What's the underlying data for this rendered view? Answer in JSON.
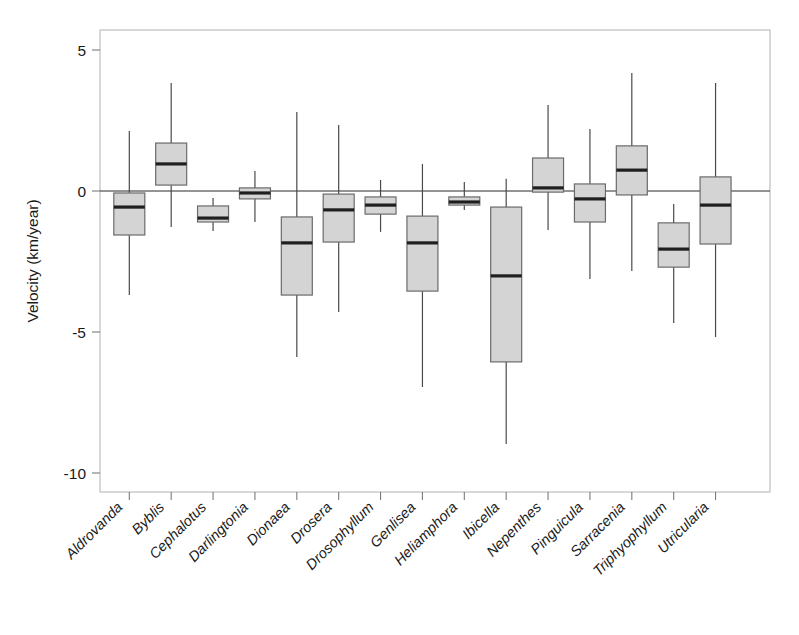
{
  "chart_data": {
    "type": "box",
    "title": "",
    "xlabel": "",
    "ylabel": "Velocity (km/year)",
    "ylim": [
      -11.3,
      6.1
    ],
    "yticks": [
      5,
      0,
      -5,
      -10
    ],
    "ytick_labels": [
      "5",
      "0",
      "-5",
      "-10"
    ],
    "grid": false,
    "legend": null,
    "zero_reference_line": 0,
    "categories": [
      "Aldrovanda",
      "Byblis",
      "Cephalotus",
      "Darlingtonia",
      "Dionaea",
      "Drosera",
      "Drosophyllum",
      "Genlisea",
      "Heliamphora",
      "Ibicella",
      "Nepenthes",
      "Pinguicula",
      "Sarracenia",
      "Triphyophyllum",
      "Utricularia"
    ],
    "boxes": [
      {
        "category": "Aldrovanda",
        "whisker_high": 2.13,
        "q3": -0.07,
        "median": -0.57,
        "q1": -1.56,
        "whisker_low": -3.69
      },
      {
        "category": "Byblis",
        "whisker_high": 3.83,
        "q3": 1.7,
        "median": 0.96,
        "q1": 0.21,
        "whisker_low": -1.28
      },
      {
        "category": "Cephalotus",
        "whisker_high": -0.25,
        "q3": -0.53,
        "median": -0.96,
        "q1": -1.1,
        "whisker_low": -1.42
      },
      {
        "category": "Darlingtonia",
        "whisker_high": 0.71,
        "q3": 0.11,
        "median": -0.07,
        "q1": -0.28,
        "whisker_low": -1.1
      },
      {
        "category": "Dionaea",
        "whisker_high": 2.8,
        "q3": -0.92,
        "median": -1.84,
        "q1": -3.69,
        "whisker_low": -5.89
      },
      {
        "category": "Drosera",
        "whisker_high": 2.34,
        "q3": -0.11,
        "median": -0.67,
        "q1": -1.81,
        "whisker_low": -4.29
      },
      {
        "category": "Drosophyllum",
        "whisker_high": 0.39,
        "q3": -0.21,
        "median": -0.5,
        "q1": -0.82,
        "whisker_low": -1.45
      },
      {
        "category": "Genlisea",
        "whisker_high": 0.96,
        "q3": -0.89,
        "median": -1.84,
        "q1": -3.55,
        "whisker_low": -6.95
      },
      {
        "category": "Heliamphora",
        "whisker_high": 0.32,
        "q3": -0.21,
        "median": -0.39,
        "q1": -0.5,
        "whisker_low": -0.67
      },
      {
        "category": "Ibicella",
        "whisker_high": 0.43,
        "q3": -0.57,
        "median": -3.01,
        "q1": -6.06,
        "whisker_low": -8.97
      },
      {
        "category": "Nepenthes",
        "whisker_high": 3.05,
        "q3": 1.17,
        "median": 0.11,
        "q1": -0.04,
        "whisker_low": -1.38
      },
      {
        "category": "Pinguicula",
        "whisker_high": 2.2,
        "q3": 0.25,
        "median": -0.28,
        "q1": -1.1,
        "whisker_low": -3.12
      },
      {
        "category": "Sarracenia",
        "whisker_high": 4.18,
        "q3": 1.6,
        "median": 0.74,
        "q1": -0.14,
        "whisker_low": -2.84
      },
      {
        "category": "Triphyophyllum",
        "whisker_high": -0.46,
        "q3": -1.13,
        "median": -2.06,
        "q1": -2.7,
        "whisker_low": -4.68
      },
      {
        "category": "Utricularia",
        "whisker_high": 3.83,
        "q3": 0.5,
        "median": -0.5,
        "q1": -1.88,
        "whisker_low": -5.18
      }
    ],
    "colors": {
      "box_fill": "#d4d4d4",
      "box_edge": "#6b6b6b",
      "median": "#1f1f1f",
      "whisker": "#4a4a4a",
      "frame": "#b9b9b9",
      "text": "#1a1a1a",
      "background": "#ffffff"
    }
  }
}
